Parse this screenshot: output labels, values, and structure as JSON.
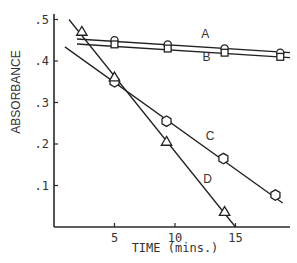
{
  "chart_data": {
    "type": "line",
    "title": "",
    "xlabel": "TIME (mins.)",
    "ylabel": "ABSORBANCE",
    "xlim": [
      0,
      19.5
    ],
    "ylim": [
      0,
      0.52
    ],
    "x_ticks": [
      5,
      10,
      15
    ],
    "x_tick_labels": [
      "5",
      "10",
      "15"
    ],
    "y_ticks": [
      0.1,
      0.2,
      0.3,
      0.4,
      0.5
    ],
    "y_tick_labels": [
      ".1",
      ".2",
      ".3",
      ".4",
      ".5"
    ],
    "grid": false,
    "legend": "inline labels",
    "series": [
      {
        "name": "A",
        "marker": "circle",
        "x": [
          5,
          9.4,
          14.1,
          18.7
        ],
        "values": [
          0.45,
          0.44,
          0.43,
          0.42
        ],
        "fit_line": [
          [
            1.9,
            0.453
          ],
          [
            19.5,
            0.42
          ]
        ]
      },
      {
        "name": "B",
        "marker": "square",
        "x": [
          5,
          9.4,
          14.1,
          18.7
        ],
        "values": [
          0.44,
          0.43,
          0.42,
          0.41
        ],
        "fit_line": [
          [
            1.9,
            0.441
          ],
          [
            19.5,
            0.408
          ]
        ]
      },
      {
        "name": "C",
        "marker": "hexagon",
        "x": [
          5,
          9.3,
          14,
          18.3
        ],
        "values": [
          0.35,
          0.255,
          0.165,
          0.077
        ],
        "fit_line": [
          [
            0.9,
            0.434
          ],
          [
            18.9,
            0.058
          ]
        ]
      },
      {
        "name": "D",
        "marker": "triangle",
        "x": [
          2.3,
          5,
          9.3,
          14.1
        ],
        "values": [
          0.47,
          0.36,
          0.205,
          0.036
        ],
        "fit_line": [
          [
            1.24,
            0.5
          ],
          [
            15.0,
            0.0
          ]
        ]
      }
    ],
    "annotations": [
      {
        "text": "A",
        "x": 12.5,
        "y": 0.455
      },
      {
        "text": "B",
        "x": 12.6,
        "y": 0.4
      },
      {
        "text": "C",
        "x": 12.9,
        "y": 0.21
      },
      {
        "text": "D",
        "x": 12.7,
        "y": 0.105
      }
    ]
  }
}
